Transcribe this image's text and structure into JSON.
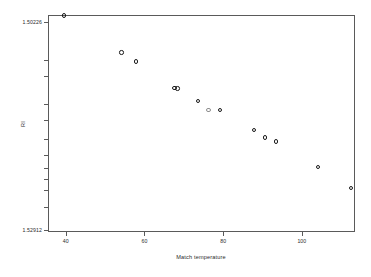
{
  "chart_data": {
    "type": "scatter",
    "title": "",
    "xlabel": "Match temperature",
    "ylabel": "RI",
    "xlim": [
      35.5,
      113.5
    ],
    "ylim": [
      1.50226,
      1.52912
    ],
    "y_axis_inverted": true,
    "grid": false,
    "legend": null,
    "x_ticks": [
      40,
      60,
      80,
      100
    ],
    "x_ticklabels": [
      "40",
      "60",
      "80",
      "100"
    ],
    "y_ticklabels": [
      "1.50226",
      "1.52912"
    ],
    "y_tick_positions_px": [
      22,
      60,
      76,
      104,
      120,
      139,
      155,
      168,
      179,
      190,
      207,
      230
    ],
    "marker": "open-circle",
    "marker_color": "#1a1a1a",
    "points": [
      {
        "x": 39.5,
        "y": 1.5023,
        "faint": false
      },
      {
        "x": 54.2,
        "y": 1.5069,
        "faint": false
      },
      {
        "x": 57.8,
        "y": 1.508,
        "faint": false
      },
      {
        "x": 67.6,
        "y": 1.5113,
        "faint": false
      },
      {
        "x": 68.4,
        "y": 1.51135,
        "faint": false
      },
      {
        "x": 73.6,
        "y": 1.5129,
        "faint": false
      },
      {
        "x": 76.3,
        "y": 1.514,
        "faint": true
      },
      {
        "x": 79.2,
        "y": 1.514,
        "faint": false
      },
      {
        "x": 87.8,
        "y": 1.5165,
        "faint": false
      },
      {
        "x": 90.7,
        "y": 1.5174,
        "faint": false
      },
      {
        "x": 93.4,
        "y": 1.5179,
        "faint": false
      },
      {
        "x": 104.1,
        "y": 1.5211,
        "faint": false
      },
      {
        "x": 112.5,
        "y": 1.5237,
        "faint": false
      }
    ]
  },
  "axes": {
    "x_label": "Match temperature",
    "y_label": "RI",
    "x_tick_labels": [
      "40",
      "60",
      "80",
      "100"
    ],
    "y_tick_label_top": "1.50226",
    "y_tick_label_bottom": "1.52912"
  }
}
